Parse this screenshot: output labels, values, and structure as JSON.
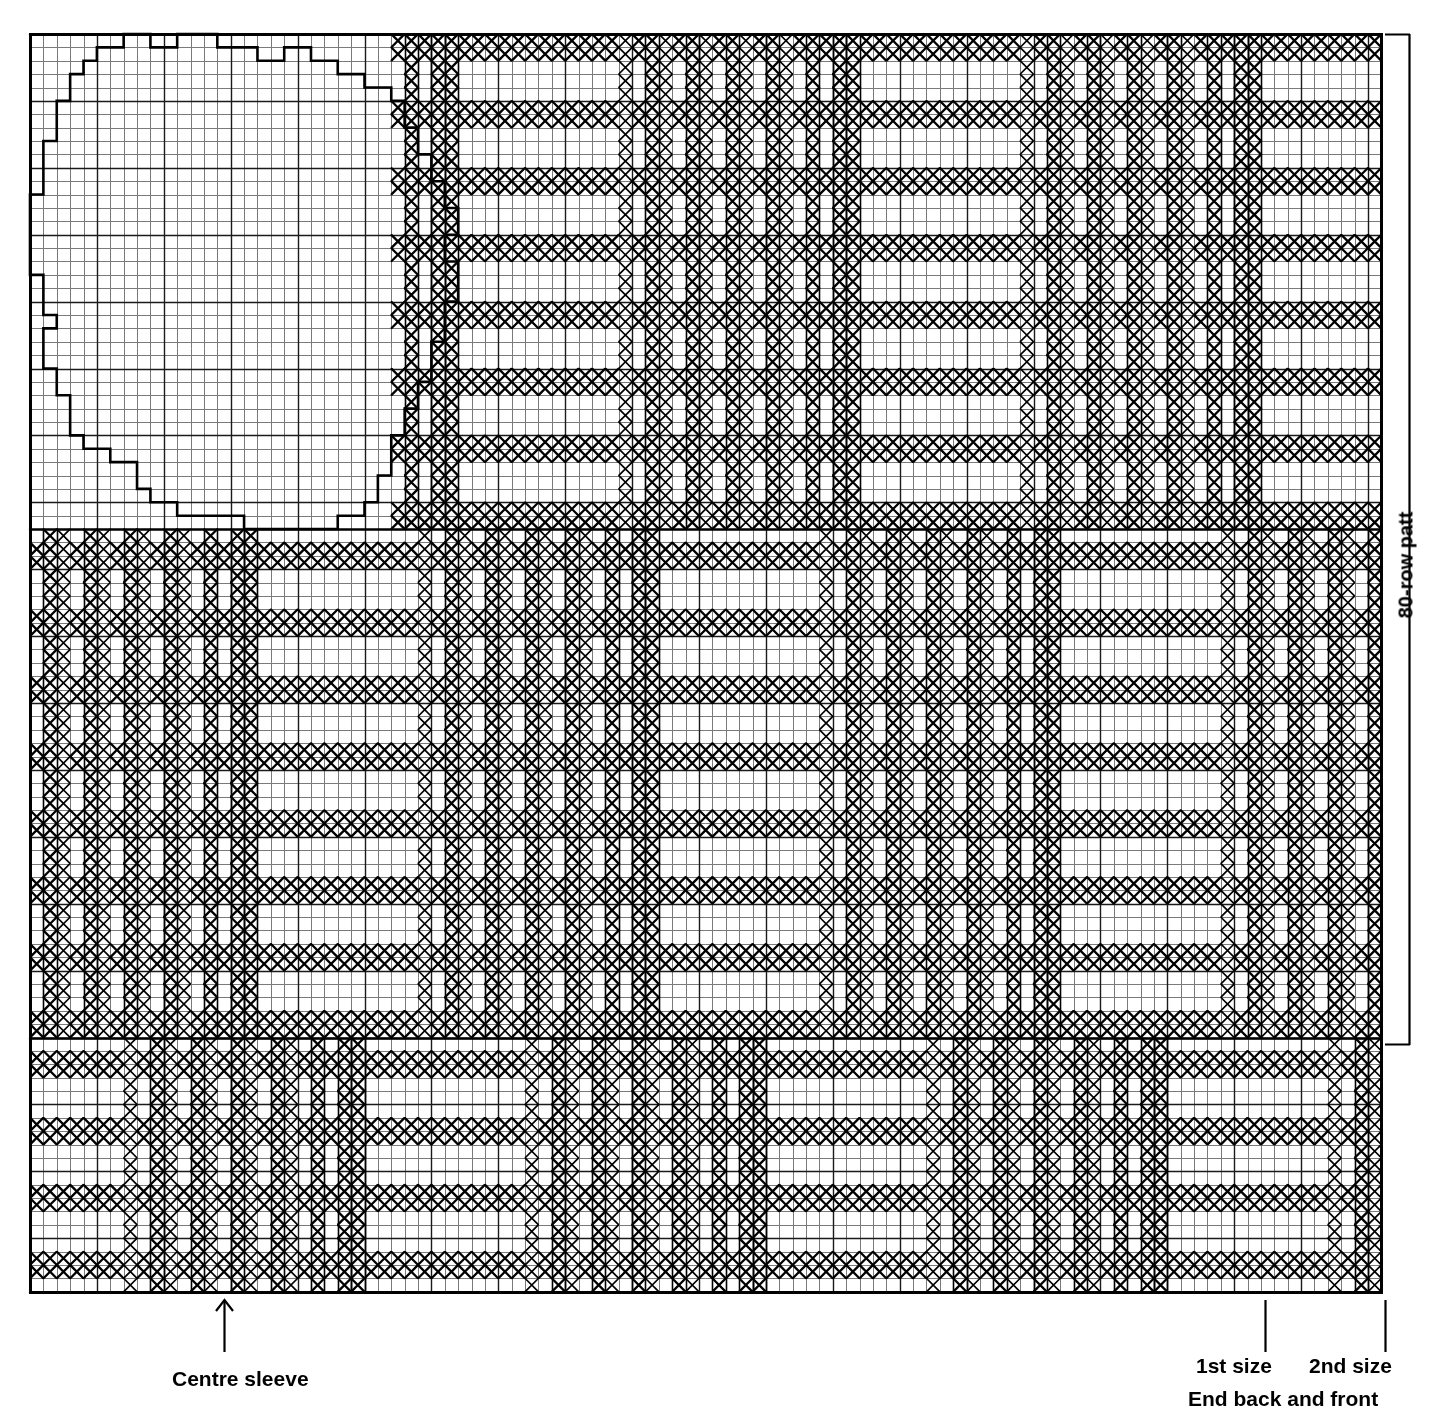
{
  "figure": {
    "title_visible": false,
    "type": "knitting-chart"
  },
  "labels": {
    "centre_sleeve": "Centre sleeve",
    "first_size": "1st size",
    "second_size": "2nd size",
    "end_back_and_front": "End back and front",
    "row_bracket": "80-row patt"
  },
  "colors": {
    "ink": "#000000",
    "paper": "#ffffff",
    "grid_minor": "#7a7a7a",
    "grid_major": "#1a1a1a"
  },
  "chart_data": {
    "type": "heatmap",
    "xlabel": "Stitches",
    "ylabel": "Rows",
    "grid": true,
    "legend_position": "none",
    "cell_px": 13.38,
    "origin_px": [
      30,
      34
    ],
    "cols": 101,
    "rows": 94,
    "xlim": [
      0,
      101
    ],
    "ylim": [
      0,
      94
    ],
    "marker": "X",
    "annotations": [
      {
        "text": "80-row patt",
        "at_px": [
          1406,
          565
        ],
        "rotation": -90,
        "bracket": {
          "x": 1385,
          "y_top": 34,
          "y_bottom": 1045,
          "arm": 25
        }
      },
      {
        "text": "Centre sleeve",
        "at_px": [
          224,
          1379
        ],
        "arrow": {
          "x": 224,
          "y_from": 1352,
          "y_to": 1300,
          "head": "up"
        }
      },
      {
        "text": "1st size",
        "at_px": [
          1232,
          1366
        ],
        "tick_px": [
          1265,
          1300,
          1352
        ]
      },
      {
        "text": "2nd size",
        "at_px": [
          1345,
          1366
        ],
        "tick_px": [
          1385,
          1300,
          1352
        ]
      },
      {
        "text": "End back and front",
        "at_px": [
          1281,
          1399
        ]
      }
    ],
    "bands": [
      {
        "name": "top-band",
        "row_start": 0,
        "row_end": 37,
        "note": "sleeve outline overlays cols 0-27; pattern runs cols 27-101"
      },
      {
        "name": "middle-band",
        "row_start": 37,
        "row_end": 75,
        "note": "full-width plaid, horizontal bars phase-shifted"
      },
      {
        "name": "bottom-band",
        "row_start": 75,
        "row_end": 94,
        "note": "full-width plaid, narrower horizontal bars"
      }
    ],
    "column_motif": {
      "period": 30,
      "description": "Repeating vertical group: wide plain field, then solid X columns and 1-col spaced pinstripes",
      "solid_cols_in_period": [
        0,
        1,
        16,
        19,
        22,
        25,
        28
      ],
      "pin_cols_in_period": [
        14,
        17,
        20,
        23,
        26
      ]
    },
    "row_motif": {
      "period": 10,
      "description": "Horizontal bars 2 rows tall separated by 3 blank rows inside the plain fields",
      "bar_rows_in_period": [
        0,
        1,
        5,
        6
      ]
    },
    "sleeve_outline": {
      "description": "Rounded sleeve-head silhouette drawn on blank graph paper, stepped pixel contour",
      "bbox_cols": [
        1,
        28
      ],
      "bbox_rows": [
        0,
        37
      ],
      "path_cols_rows": [
        [
          7,
          0
        ],
        [
          7,
          1
        ],
        [
          5,
          1
        ],
        [
          5,
          2
        ],
        [
          4,
          2
        ],
        [
          4,
          3
        ],
        [
          3,
          3
        ],
        [
          3,
          5
        ],
        [
          2,
          5
        ],
        [
          2,
          8
        ],
        [
          1,
          8
        ],
        [
          1,
          12
        ],
        [
          0,
          12
        ],
        [
          0,
          18
        ],
        [
          1,
          18
        ],
        [
          1,
          21
        ],
        [
          2,
          21
        ],
        [
          2,
          22
        ],
        [
          1,
          22
        ],
        [
          1,
          25
        ],
        [
          2,
          25
        ],
        [
          2,
          27
        ],
        [
          3,
          27
        ],
        [
          3,
          30
        ],
        [
          4,
          30
        ],
        [
          4,
          31
        ],
        [
          6,
          31
        ],
        [
          6,
          32
        ],
        [
          8,
          32
        ],
        [
          8,
          34
        ],
        [
          9,
          34
        ],
        [
          9,
          35
        ],
        [
          11,
          35
        ],
        [
          11,
          36
        ],
        [
          16,
          36
        ],
        [
          16,
          37
        ],
        [
          23,
          37
        ],
        [
          23,
          36
        ],
        [
          25,
          36
        ],
        [
          25,
          35
        ],
        [
          26,
          35
        ],
        [
          26,
          33
        ],
        [
          27,
          33
        ],
        [
          27,
          30
        ],
        [
          28,
          30
        ],
        [
          28,
          28
        ],
        [
          29,
          28
        ],
        [
          29,
          26
        ],
        [
          30,
          26
        ],
        [
          30,
          23
        ],
        [
          31,
          23
        ],
        [
          31,
          20
        ],
        [
          32,
          20
        ],
        [
          32,
          17
        ],
        [
          31,
          17
        ],
        [
          31,
          15
        ],
        [
          32,
          15
        ],
        [
          32,
          13
        ],
        [
          31,
          13
        ],
        [
          31,
          11
        ],
        [
          30,
          11
        ],
        [
          30,
          9
        ],
        [
          29,
          9
        ],
        [
          29,
          7
        ],
        [
          28,
          7
        ],
        [
          28,
          5
        ],
        [
          27,
          5
        ],
        [
          27,
          4
        ],
        [
          25,
          4
        ],
        [
          25,
          3
        ],
        [
          23,
          3
        ],
        [
          23,
          2
        ],
        [
          21,
          2
        ],
        [
          21,
          1
        ],
        [
          19,
          1
        ],
        [
          19,
          2
        ],
        [
          17,
          2
        ],
        [
          17,
          1
        ],
        [
          14,
          1
        ],
        [
          14,
          0
        ],
        [
          11,
          0
        ],
        [
          11,
          1
        ],
        [
          9,
          1
        ],
        [
          9,
          0
        ],
        [
          7,
          0
        ]
      ]
    }
  }
}
